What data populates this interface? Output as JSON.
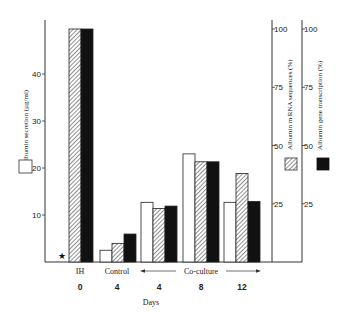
{
  "chart_data": {
    "type": "bar",
    "title": "",
    "xlabel": "Days",
    "categories": [
      "IH",
      "Control",
      "Co-culture",
      "Co-culture",
      "Co-culture"
    ],
    "x_days": [
      "0",
      "4",
      "4",
      "8",
      "12"
    ],
    "group_labels": {
      "ih": "IH",
      "control": "Control",
      "coculture": "Co-culture"
    },
    "series": [
      {
        "name": "Albumin secretion (µg/ml)",
        "pattern": "open",
        "axis": "left",
        "values": [
          null,
          2.5,
          12.7,
          23,
          12.7
        ]
      },
      {
        "name": "Albumin mRNA sequences (%)",
        "pattern": "hatched",
        "axis": "right1",
        "values": [
          100,
          8,
          23,
          43,
          38
        ]
      },
      {
        "name": "Albumin gene transcription (%)",
        "pattern": "solid",
        "axis": "right2",
        "values": [
          100,
          12,
          24,
          43,
          26
        ]
      }
    ],
    "axes": {
      "left": {
        "label": "Albumin secretion (µg/ml)",
        "ticks": [
          10,
          20,
          30,
          40
        ],
        "ylim": [
          0,
          50
        ]
      },
      "right1": {
        "label": "Albumin m RNA sequences (%)",
        "ticks": [
          25,
          50,
          75,
          100
        ],
        "ylim": [
          0,
          100
        ]
      },
      "right2": {
        "label": "Albumin gene transcription (%)",
        "ticks": [
          25,
          50,
          75,
          100
        ],
        "ylim": [
          0,
          100
        ]
      }
    },
    "annotations": [
      {
        "symbol": "★",
        "note": "no secretion value shown for IH (day 0)"
      }
    ],
    "legend": "squares beside each y-axis: open = secretion, hatched = mRNA, solid = transcription",
    "grid": false
  }
}
